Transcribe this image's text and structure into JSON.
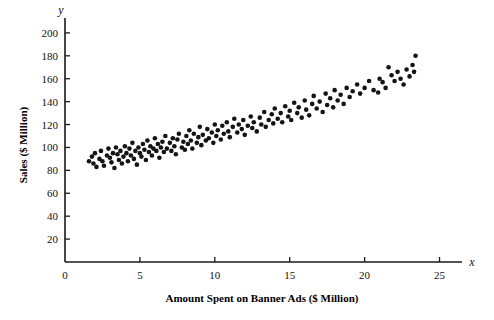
{
  "chart_data": {
    "type": "scatter",
    "title": "",
    "xlabel": "Amount Spent on Banner Ads ($ Million)",
    "ylabel": "Sales ($ Million)",
    "x_axis_symbol": "x",
    "y_axis_symbol": "y",
    "xlim": [
      0,
      26.5
    ],
    "ylim": [
      0,
      213
    ],
    "xticks": [
      0,
      5,
      10,
      15,
      20,
      25
    ],
    "yticks": [
      20,
      40,
      60,
      80,
      100,
      120,
      140,
      160,
      180,
      200
    ],
    "grid": false,
    "legend": null,
    "marker_color": "#141414",
    "marker_size_px": 4.6,
    "n_points": 152,
    "points": [
      [
        1.6,
        88
      ],
      [
        1.8,
        92
      ],
      [
        1.9,
        86
      ],
      [
        2.0,
        95
      ],
      [
        2.1,
        83
      ],
      [
        2.3,
        90
      ],
      [
        2.4,
        97
      ],
      [
        2.5,
        88
      ],
      [
        2.6,
        84
      ],
      [
        2.8,
        93
      ],
      [
        2.9,
        99
      ],
      [
        3.0,
        91
      ],
      [
        3.1,
        87
      ],
      [
        3.2,
        95
      ],
      [
        3.3,
        82
      ],
      [
        3.4,
        100
      ],
      [
        3.5,
        94
      ],
      [
        3.6,
        89
      ],
      [
        3.7,
        97
      ],
      [
        3.8,
        86
      ],
      [
        3.9,
        92
      ],
      [
        4.0,
        101
      ],
      [
        4.1,
        95
      ],
      [
        4.2,
        88
      ],
      [
        4.3,
        99
      ],
      [
        4.4,
        93
      ],
      [
        4.5,
        104
      ],
      [
        4.6,
        90
      ],
      [
        4.7,
        97
      ],
      [
        4.8,
        85
      ],
      [
        4.9,
        100
      ],
      [
        5.0,
        95
      ],
      [
        5.1,
        92
      ],
      [
        5.2,
        103
      ],
      [
        5.3,
        98
      ],
      [
        5.4,
        89
      ],
      [
        5.5,
        106
      ],
      [
        5.6,
        96
      ],
      [
        5.7,
        101
      ],
      [
        5.8,
        93
      ],
      [
        5.9,
        99
      ],
      [
        6.0,
        108
      ],
      [
        6.1,
        97
      ],
      [
        6.2,
        103
      ],
      [
        6.3,
        91
      ],
      [
        6.4,
        100
      ],
      [
        6.5,
        105
      ],
      [
        6.6,
        96
      ],
      [
        6.7,
        110
      ],
      [
        6.8,
        99
      ],
      [
        7.0,
        104
      ],
      [
        7.1,
        97
      ],
      [
        7.2,
        108
      ],
      [
        7.3,
        101
      ],
      [
        7.4,
        94
      ],
      [
        7.5,
        107
      ],
      [
        7.6,
        112
      ],
      [
        7.8,
        100
      ],
      [
        7.9,
        105
      ],
      [
        8.0,
        98
      ],
      [
        8.1,
        110
      ],
      [
        8.2,
        103
      ],
      [
        8.3,
        115
      ],
      [
        8.4,
        106
      ],
      [
        8.5,
        99
      ],
      [
        8.6,
        112
      ],
      [
        8.8,
        104
      ],
      [
        8.9,
        109
      ],
      [
        9.0,
        118
      ],
      [
        9.1,
        102
      ],
      [
        9.2,
        111
      ],
      [
        9.4,
        106
      ],
      [
        9.5,
        116
      ],
      [
        9.6,
        108
      ],
      [
        9.8,
        113
      ],
      [
        9.9,
        104
      ],
      [
        10.0,
        120
      ],
      [
        10.1,
        110
      ],
      [
        10.2,
        115
      ],
      [
        10.4,
        107
      ],
      [
        10.5,
        119
      ],
      [
        10.6,
        112
      ],
      [
        10.8,
        122
      ],
      [
        10.9,
        114
      ],
      [
        11.0,
        109
      ],
      [
        11.2,
        118
      ],
      [
        11.3,
        125
      ],
      [
        11.5,
        113
      ],
      [
        11.6,
        120
      ],
      [
        11.8,
        116
      ],
      [
        11.9,
        124
      ],
      [
        12.0,
        111
      ],
      [
        12.2,
        119
      ],
      [
        12.4,
        127
      ],
      [
        12.5,
        117
      ],
      [
        12.6,
        122
      ],
      [
        12.8,
        114
      ],
      [
        13.0,
        126
      ],
      [
        13.1,
        120
      ],
      [
        13.3,
        131
      ],
      [
        13.4,
        118
      ],
      [
        13.6,
        124
      ],
      [
        13.8,
        129
      ],
      [
        13.9,
        121
      ],
      [
        14.0,
        134
      ],
      [
        14.2,
        125
      ],
      [
        14.4,
        130
      ],
      [
        14.5,
        122
      ],
      [
        14.7,
        136
      ],
      [
        14.9,
        127
      ],
      [
        15.0,
        132
      ],
      [
        15.1,
        124
      ],
      [
        15.3,
        139
      ],
      [
        15.5,
        130
      ],
      [
        15.6,
        135
      ],
      [
        15.8,
        126
      ],
      [
        16.0,
        141
      ],
      [
        16.1,
        133
      ],
      [
        16.3,
        128
      ],
      [
        16.5,
        138
      ],
      [
        16.6,
        145
      ],
      [
        16.8,
        134
      ],
      [
        17.0,
        140
      ],
      [
        17.2,
        131
      ],
      [
        17.4,
        147
      ],
      [
        17.5,
        137
      ],
      [
        17.7,
        143
      ],
      [
        17.9,
        135
      ],
      [
        18.0,
        150
      ],
      [
        18.2,
        141
      ],
      [
        18.4,
        146
      ],
      [
        18.6,
        138
      ],
      [
        18.8,
        152
      ],
      [
        19.0,
        144
      ],
      [
        19.2,
        149
      ],
      [
        19.5,
        155
      ],
      [
        19.7,
        147
      ],
      [
        20.0,
        152
      ],
      [
        20.3,
        158
      ],
      [
        20.6,
        150
      ],
      [
        20.9,
        148
      ],
      [
        21.0,
        160
      ],
      [
        21.2,
        157
      ],
      [
        21.4,
        152
      ],
      [
        21.6,
        170
      ],
      [
        21.8,
        163
      ],
      [
        22.0,
        158
      ],
      [
        22.2,
        166
      ],
      [
        22.4,
        160
      ],
      [
        22.6,
        155
      ],
      [
        22.8,
        168
      ],
      [
        23.0,
        162
      ],
      [
        23.2,
        172
      ],
      [
        23.3,
        166
      ],
      [
        23.4,
        180
      ]
    ]
  }
}
